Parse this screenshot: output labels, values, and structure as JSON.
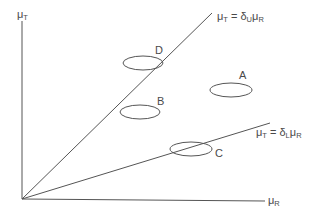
{
  "diagram": {
    "axes": {
      "y_label": {
        "symbol": "μ",
        "subscript": "T"
      },
      "x_label": {
        "symbol": "μ",
        "subscript": "R"
      }
    },
    "lines": [
      {
        "id": "upper",
        "label_prefix": "μ",
        "label_sub1": "T",
        "label_eq": " = δ",
        "label_sub2": "U",
        "label_mu": "μ",
        "label_sub3": "R"
      },
      {
        "id": "lower",
        "label_prefix": "μ",
        "label_sub1": "T",
        "label_eq": " = δ",
        "label_sub2": "L",
        "label_mu": "μ",
        "label_sub3": "R"
      }
    ],
    "regions": [
      {
        "label": "A"
      },
      {
        "label": "B"
      },
      {
        "label": "C"
      },
      {
        "label": "D"
      }
    ],
    "colors": {
      "line": "#555555",
      "text": "#4a4a4a"
    }
  }
}
